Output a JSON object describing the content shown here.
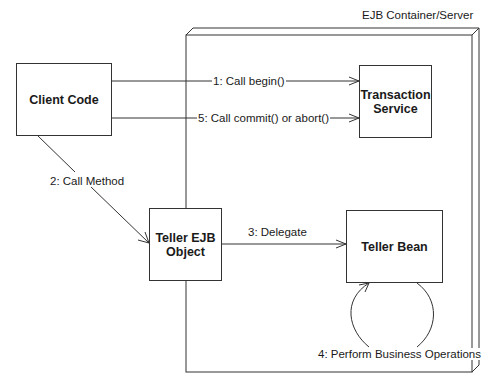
{
  "container": {
    "label": "EJB Container/Server"
  },
  "nodes": {
    "client_code": "Client Code",
    "transaction_service": "Transaction Service",
    "teller_ejb_object": "Teller EJB Object",
    "teller_bean": "Teller Bean"
  },
  "messages": {
    "m1": "1: Call begin()",
    "m2": "2: Call Method",
    "m3": "3: Delegate",
    "m4": "4: Perform Business Operations",
    "m5": "5: Call commit() or abort()"
  },
  "colors": {
    "line": "#333333",
    "background": "#ffffff"
  }
}
